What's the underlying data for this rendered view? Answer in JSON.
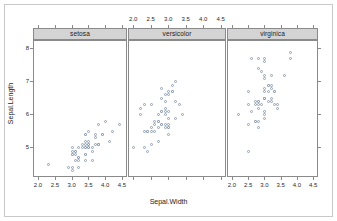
{
  "chart_data": {
    "type": "scatter",
    "title": "",
    "xlabel": "Sepal.Width",
    "ylabel": "Sepal.Length",
    "conditioning_variable": "Species",
    "grid": false,
    "legend": "none",
    "xlim": [
      1.85,
      4.65
    ],
    "ylim": [
      4.1,
      8.25
    ],
    "xticks": [
      2.0,
      2.5,
      3.0,
      3.5,
      4.0,
      4.5
    ],
    "xtick_labels": [
      "2.0",
      "2.5",
      "3.0",
      "3.5",
      "4.0",
      "4.5"
    ],
    "yticks": [
      5,
      6,
      7,
      8
    ],
    "ytick_labels": [
      "5",
      "6",
      "7",
      "8"
    ],
    "top_axis_labelled_panel": 2,
    "bottom_axis_labelled_panels": [
      1,
      3
    ],
    "point_color": "#8f9fb5",
    "strip_fill": "#d4d4d4",
    "border_color": "#8a8a8a",
    "panels": [
      {
        "strip_label": "setosa",
        "x": [
          3.5,
          3.0,
          3.2,
          3.1,
          3.6,
          3.9,
          3.4,
          3.4,
          2.9,
          3.1,
          3.7,
          3.4,
          3.0,
          3.0,
          4.0,
          4.4,
          3.9,
          3.5,
          3.8,
          3.8,
          3.4,
          3.7,
          3.6,
          3.3,
          3.4,
          3.0,
          3.4,
          3.5,
          3.4,
          3.2,
          3.1,
          3.4,
          4.1,
          4.2,
          3.1,
          3.2,
          3.5,
          3.6,
          3.0,
          3.4,
          3.5,
          2.3,
          3.2,
          3.5,
          3.8,
          3.0,
          3.8,
          3.2,
          3.7,
          3.3
        ],
        "y": [
          5.1,
          4.9,
          4.7,
          4.6,
          5.0,
          5.4,
          4.6,
          5.0,
          4.4,
          4.9,
          5.4,
          4.8,
          4.8,
          4.3,
          5.8,
          5.7,
          5.4,
          5.1,
          5.7,
          5.1,
          5.4,
          5.1,
          4.6,
          5.1,
          4.8,
          5.0,
          5.0,
          5.2,
          5.2,
          4.7,
          4.8,
          5.4,
          5.2,
          5.5,
          4.9,
          5.0,
          5.5,
          4.9,
          4.4,
          5.1,
          5.0,
          4.5,
          4.4,
          5.0,
          5.1,
          4.8,
          5.1,
          4.6,
          5.3,
          5.0
        ]
      },
      {
        "strip_label": "versicolor",
        "x": [
          3.2,
          3.2,
          3.1,
          2.3,
          2.8,
          2.8,
          3.3,
          2.4,
          2.9,
          2.7,
          2.0,
          3.0,
          2.2,
          2.9,
          2.9,
          3.1,
          3.0,
          2.7,
          2.2,
          2.5,
          3.2,
          2.8,
          2.5,
          2.8,
          2.9,
          3.0,
          2.8,
          3.0,
          2.9,
          2.6,
          2.4,
          2.4,
          2.7,
          2.7,
          3.0,
          3.4,
          3.1,
          2.3,
          3.0,
          2.5,
          2.6,
          3.0,
          2.6,
          2.3,
          2.7,
          3.0,
          2.9,
          2.9,
          2.5,
          2.8
        ],
        "y": [
          7.0,
          6.4,
          6.9,
          5.5,
          6.5,
          5.7,
          6.3,
          4.9,
          6.6,
          5.2,
          5.0,
          5.9,
          6.0,
          6.1,
          5.6,
          6.7,
          5.6,
          5.8,
          6.2,
          5.6,
          5.9,
          6.1,
          6.3,
          6.1,
          6.4,
          6.6,
          6.8,
          6.7,
          6.0,
          5.7,
          5.5,
          5.5,
          5.8,
          6.0,
          5.4,
          6.0,
          6.7,
          6.3,
          5.6,
          5.5,
          5.5,
          6.1,
          5.8,
          5.0,
          5.6,
          5.7,
          5.7,
          6.2,
          5.1,
          5.7
        ]
      },
      {
        "strip_label": "virginica",
        "x": [
          3.3,
          2.7,
          3.0,
          2.9,
          3.0,
          3.0,
          2.5,
          2.9,
          2.5,
          3.6,
          3.2,
          2.7,
          3.0,
          2.5,
          2.8,
          3.2,
          3.0,
          3.8,
          2.6,
          2.2,
          3.2,
          2.8,
          2.8,
          2.7,
          3.3,
          3.2,
          2.8,
          3.0,
          2.8,
          3.0,
          2.8,
          3.8,
          2.8,
          2.8,
          2.6,
          3.0,
          3.4,
          3.1,
          3.0,
          3.1,
          3.1,
          3.1,
          2.7,
          3.2,
          3.3,
          3.0,
          2.5,
          3.0,
          3.4,
          3.0
        ],
        "y": [
          6.3,
          5.8,
          7.1,
          6.3,
          6.5,
          7.6,
          4.9,
          7.3,
          6.7,
          7.2,
          6.5,
          6.4,
          6.8,
          5.7,
          5.8,
          6.4,
          6.5,
          7.7,
          7.7,
          6.0,
          6.9,
          5.6,
          7.7,
          6.3,
          6.7,
          7.2,
          6.2,
          6.1,
          6.4,
          7.2,
          7.4,
          7.9,
          6.4,
          6.3,
          6.1,
          7.7,
          6.3,
          6.4,
          6.0,
          6.9,
          6.7,
          6.9,
          5.8,
          6.8,
          6.7,
          6.7,
          6.3,
          6.5,
          6.2,
          5.9
        ]
      }
    ]
  }
}
